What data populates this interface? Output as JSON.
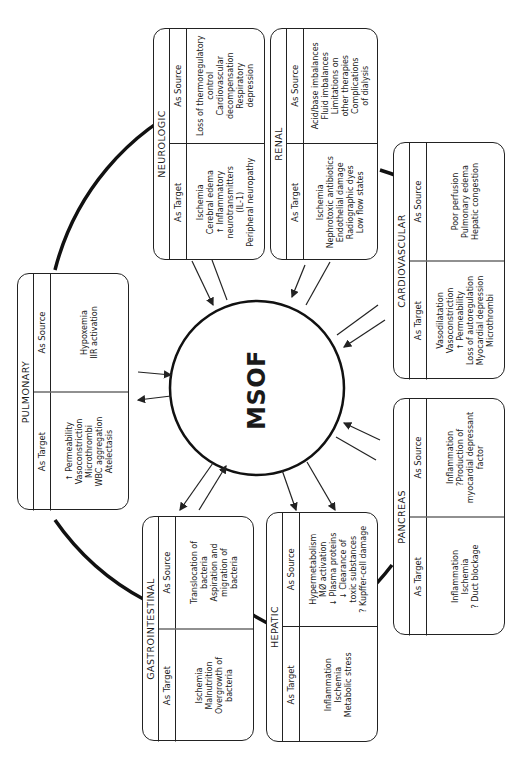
{
  "center": {
    "label": "MSOF"
  },
  "column_headers": {
    "target": "As Target",
    "source": "As Source"
  },
  "organs": {
    "pulmonary": {
      "title": "PULMONARY",
      "as_target": [
        "↑ Permeability",
        "Vasoconstriction",
        "Microthrombi",
        "WBC aggregation",
        "Atelectasis"
      ],
      "as_source": [
        "Hypoxemia",
        "IIR activation"
      ]
    },
    "gastrointestinal": {
      "title": "GASTROINTESTINAL",
      "as_target": [
        "Ischemia",
        "Malnutrition",
        "Overgrowth of",
        "bacteria"
      ],
      "as_source": [
        "Translocation of",
        "bacteria",
        "Aspiration and",
        "migration of",
        "bacteria"
      ]
    },
    "hepatic": {
      "title": "HEPATIC",
      "as_target": [
        "Inflammation",
        "Ischemia",
        "Metabolic stress"
      ],
      "as_source": [
        "Hypermetabolism",
        "MØ activation",
        "↓ Plasma proteins",
        "↓ Clearance of",
        "toxic substances",
        "? Kupffer-cell damage"
      ]
    },
    "pancreas": {
      "title": "PANCREAS",
      "as_target": [
        "Inflammation",
        "Ischemia",
        "? Duct blockage"
      ],
      "as_source": [
        "Inflammation",
        "?Production of",
        "myocardial depressant",
        "factor"
      ]
    },
    "cardiovascular": {
      "title": "CARDIOVASCULAR",
      "as_target": [
        "Vasodilatation",
        "Vasoconstriction",
        "↑ Permeability",
        "Loss of autoregulation",
        "Myocardial depression",
        "Microthrombi"
      ],
      "as_source": [
        "Poor perfusion",
        "Pulmonary edema",
        "Hepatic congestion"
      ]
    },
    "renal": {
      "title": "RENAL",
      "as_target": [
        "Ischemia",
        "Nephrotoxic antibiotics",
        "Endothelial damage",
        "Radiographic dyes",
        "Low flow states"
      ],
      "as_source": [
        "Acid/base imbalances",
        "Fluid imbalances",
        "Limitations on",
        "other therapies",
        "Complications",
        "of dialysis"
      ]
    },
    "neurologic": {
      "title": "NEUROLOGIC",
      "as_target": [
        "Ischemia",
        "Cerebral edema",
        "↑ Inflammatory",
        "neurotransmitters",
        "(IL-1)",
        "Peripheral neuropathy"
      ],
      "as_source": [
        "Loss of thermoregulatory",
        "control",
        "Cardiovascular",
        "decompensation",
        "Respiratory",
        "depression"
      ]
    }
  }
}
